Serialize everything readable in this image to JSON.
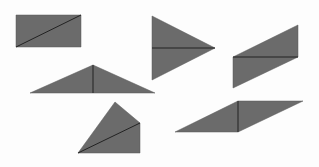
{
  "canvas": {
    "width": 319,
    "height": 167,
    "background": "#fdfdfd"
  },
  "style": {
    "fill": "#6b6b6b",
    "stroke": "#222222"
  },
  "shapes": [
    {
      "name": "rectangle-split-diagonal",
      "points": "16,15 81,15 81,47 16,47",
      "divider": [
        16,
        47,
        81,
        15
      ]
    },
    {
      "name": "triangle-pointing-right",
      "points": "152,16 215,48 152,80",
      "divider": [
        152,
        48,
        215,
        48
      ]
    },
    {
      "name": "parallelogram-horizontal-split",
      "points": "233,57 298,25 298,57 233,88",
      "divider": [
        233,
        57,
        298,
        57
      ]
    },
    {
      "name": "wide-triangle-vertical-split",
      "points": "30,93 93,65 155,93",
      "divider": [
        93,
        65,
        93,
        93
      ]
    },
    {
      "name": "quadrilateral-diagonal-split",
      "points": "78,153 115,102 140,123 140,153",
      "divider": [
        78,
        153,
        140,
        123
      ]
    },
    {
      "name": "parallelogram-vertical-split",
      "points": "175,132 238,101 303,101 238,132",
      "divider": [
        238,
        101,
        238,
        132
      ]
    }
  ]
}
